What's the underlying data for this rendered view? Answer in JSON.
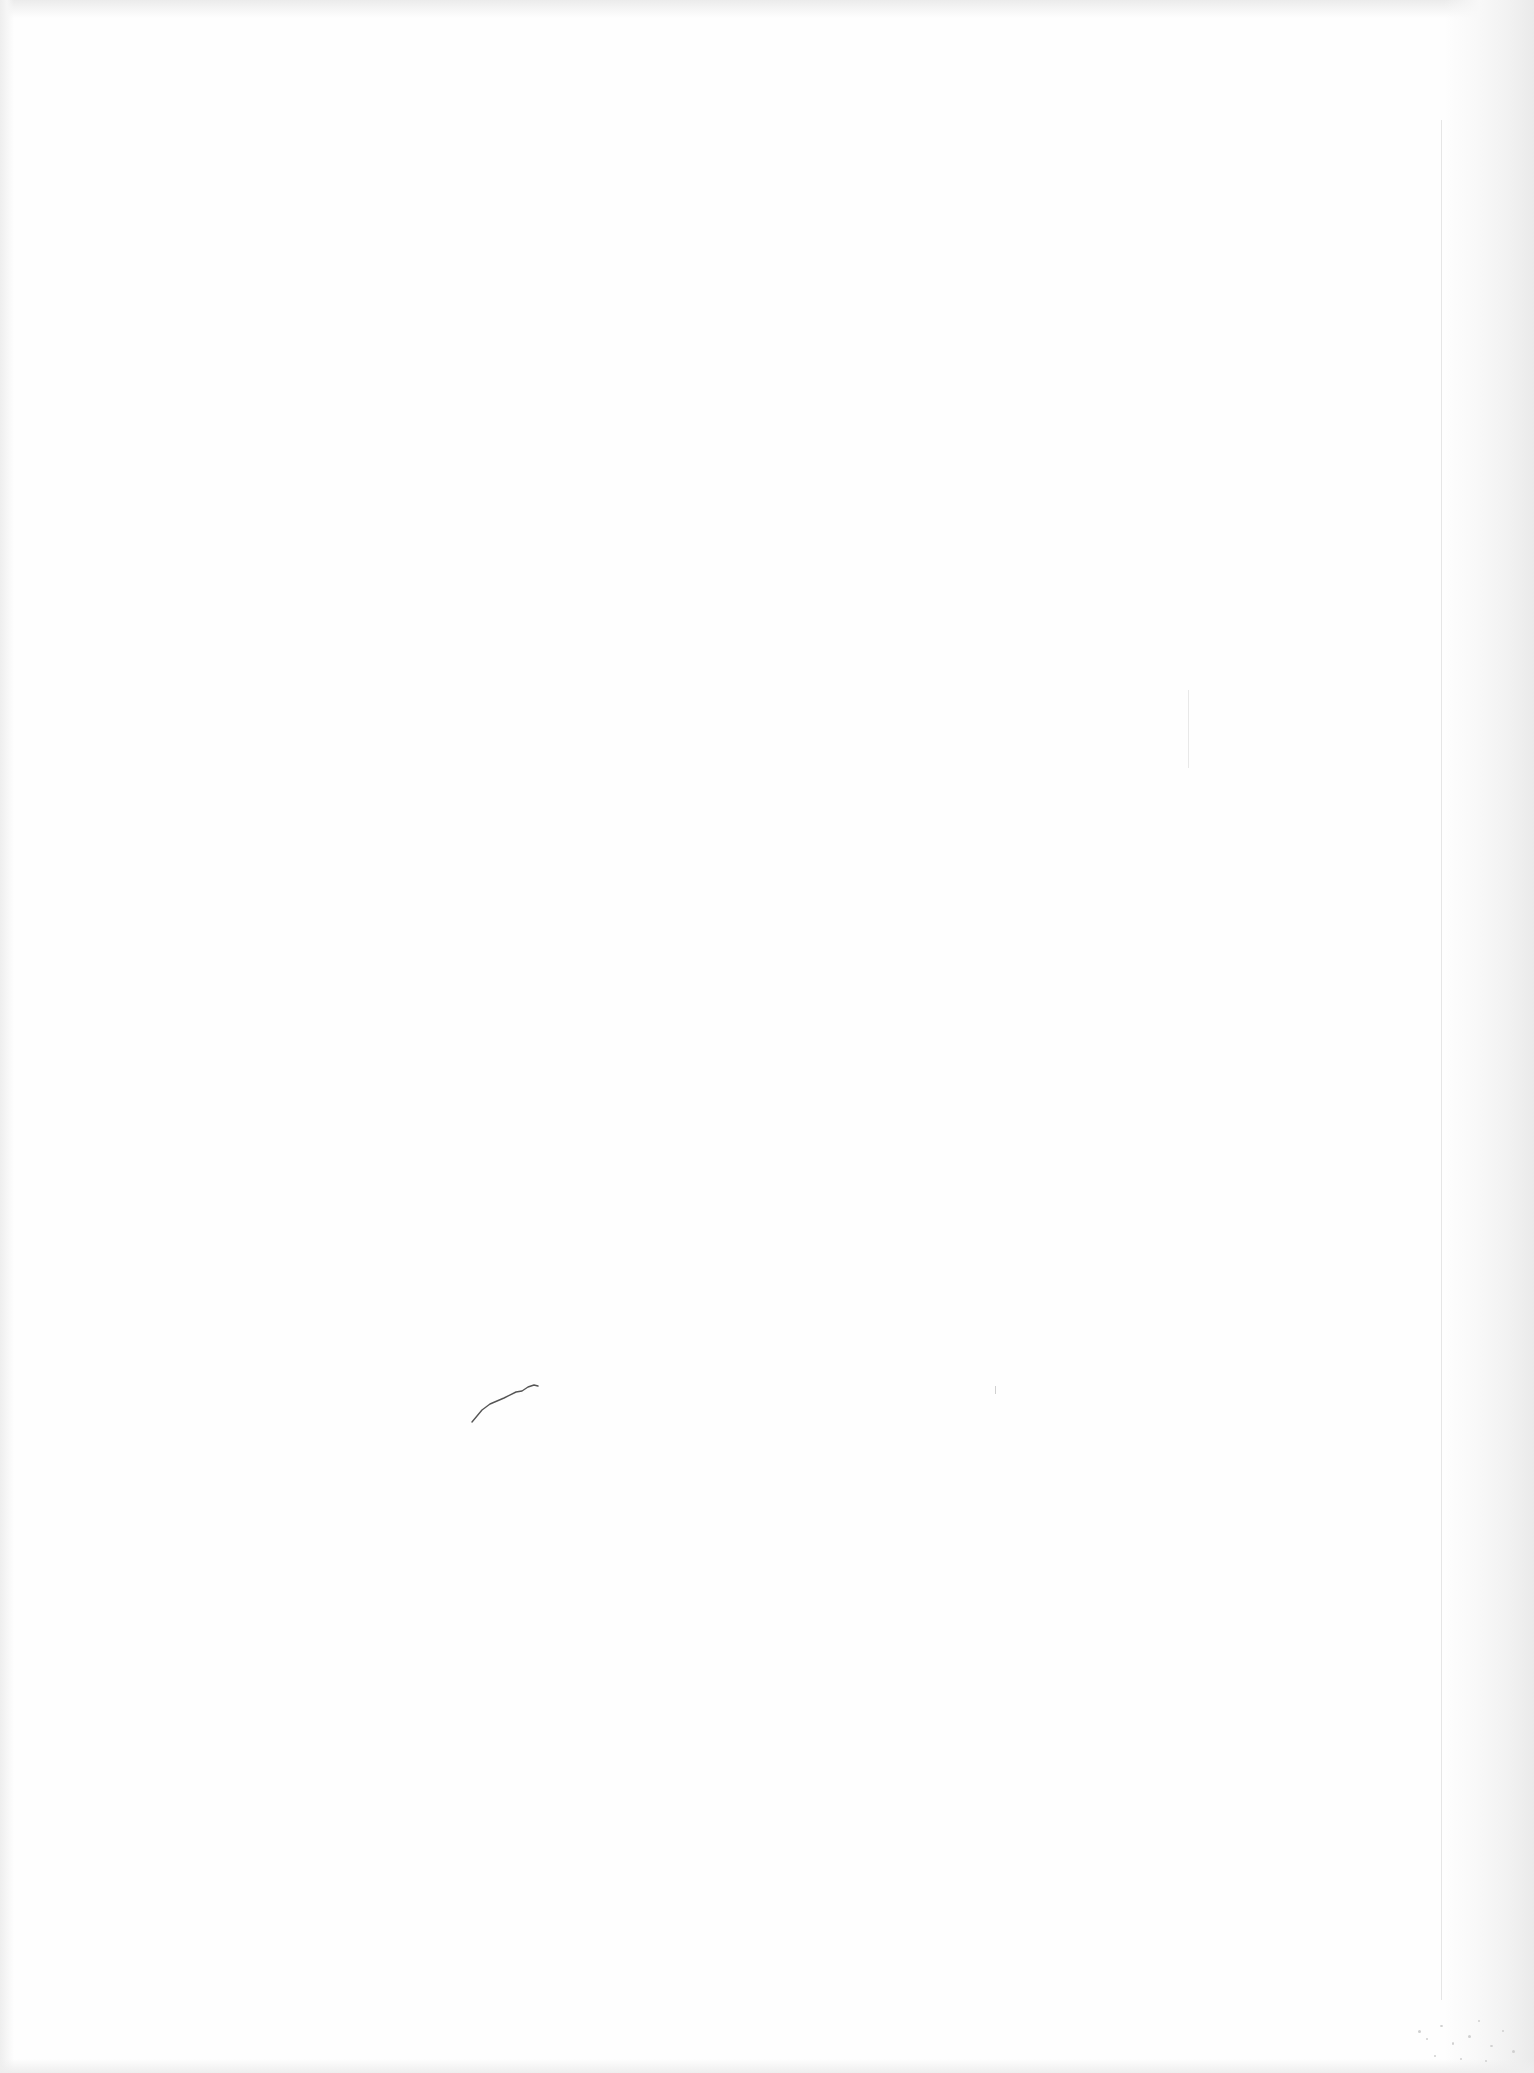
{
  "document": {
    "type": "blank scanned page",
    "text_content": "",
    "background_color": "#fefefe",
    "edge_shadow_color": "#eaeaea"
  },
  "marks": {
    "pencil_stroke": {
      "x": 470,
      "y": 1378,
      "width": 70,
      "height": 45,
      "color": "#555555"
    },
    "fold_line": {
      "x": 1441,
      "y_start": 120,
      "y_end": 2000,
      "color": "#e6e6e6"
    },
    "faint_vertical_mark": {
      "x": 1188,
      "y_start": 690,
      "y_end": 768,
      "color": "#e8e8e8"
    },
    "small_mark": {
      "x": 995,
      "y": 1388,
      "color": "#d0d0d0"
    }
  }
}
